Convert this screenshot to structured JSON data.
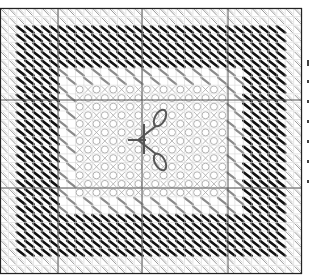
{
  "chart_data": {
    "type": "stitch-pattern-chart",
    "title": "",
    "grid": {
      "left": 0,
      "top": 8,
      "right": 302,
      "bottom": 274,
      "cell": 8.5,
      "major_lines_x": [
        58,
        142,
        228
      ],
      "major_lines_y": [
        100,
        188
      ]
    },
    "bands": [
      {
        "name": "outer-border",
        "color": "#9a9a9a",
        "style": "double-diagonal-hatch",
        "inset": 0
      },
      {
        "name": "dark-band",
        "color": "#111111",
        "style": "diagonal-stitch",
        "inset": 2
      },
      {
        "name": "gray-band",
        "color": "#8a8a8a",
        "style": "diagonal-stitch",
        "inset": 7
      },
      {
        "name": "center-lattice",
        "color": "#a8a8a8",
        "style": "octagon-lattice",
        "inset": 9
      }
    ],
    "motif": {
      "name": "scissors",
      "cx": 148,
      "cy": 140,
      "color": "#555555"
    }
  },
  "side_marks": {
    "count": 7
  }
}
